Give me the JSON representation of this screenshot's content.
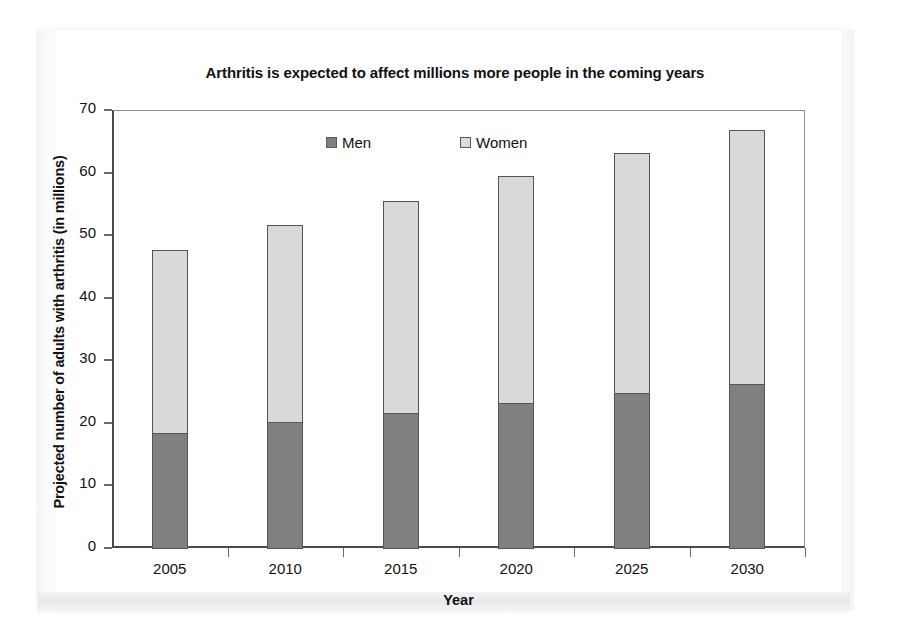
{
  "chart_data": {
    "type": "bar",
    "subtype": "stacked-bar",
    "title": "Arthritis is expected to affect millions more people in the coming years",
    "xlabel": "Year",
    "ylabel": "Projected number of adults with arthritis (in millions)",
    "categories": [
      "2005",
      "2010",
      "2015",
      "2020",
      "2025",
      "2030"
    ],
    "series": [
      {
        "name": "Men",
        "color": "#808080",
        "values": [
          18.5,
          20.3,
          21.7,
          23.3,
          24.9,
          26.4
        ]
      },
      {
        "name": "Women",
        "color": "#d9d9d9",
        "values": [
          29.5,
          31.7,
          34.1,
          36.4,
          38.5,
          40.8
        ]
      }
    ],
    "totals": [
      48.0,
      52.0,
      55.8,
      59.7,
      63.4,
      67.2
    ],
    "ylim": [
      0,
      70
    ],
    "yticks": [
      0,
      10,
      20,
      30,
      40,
      50,
      60,
      70
    ],
    "ytick_labels": [
      "0",
      "10",
      "20",
      "30",
      "40",
      "50",
      "60",
      "70"
    ],
    "grid": false,
    "legend_position": "top-center",
    "stack_order": [
      "Men",
      "Women"
    ]
  },
  "legend": {
    "men_label": "Men",
    "women_label": "Women"
  },
  "colors": {
    "men": "#808080",
    "women": "#d9d9d9",
    "axis": "#4a4a4a",
    "text": "#111111"
  }
}
